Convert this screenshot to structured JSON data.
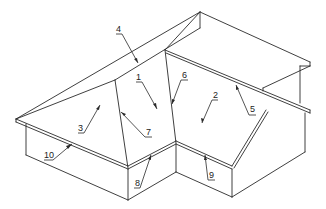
{
  "diagram": {
    "type": "isometric roof line drawing",
    "background": "#ffffff",
    "stroke_color": "#2a2a2a",
    "callouts": [
      {
        "id": "1",
        "label": "1",
        "x": 136,
        "y": 81,
        "arrow_to": [
          157,
          109
        ]
      },
      {
        "id": "2",
        "label": "2",
        "x": 214,
        "y": 99,
        "arrow_to": [
          202,
          123
        ]
      },
      {
        "id": "3",
        "label": "3",
        "x": 78,
        "y": 132,
        "arrow_to": [
          100,
          105
        ]
      },
      {
        "id": "4",
        "label": "4",
        "x": 116,
        "y": 33,
        "arrow_to": [
          138,
          63
        ]
      },
      {
        "id": "5",
        "label": "5",
        "x": 250,
        "y": 113,
        "arrow_to": [
          236,
          85
        ]
      },
      {
        "id": "6",
        "label": "6",
        "x": 183,
        "y": 79,
        "arrow_to": [
          172,
          104
        ]
      },
      {
        "id": "7",
        "label": "7",
        "x": 146,
        "y": 136,
        "arrow_to": [
          121,
          112
        ]
      },
      {
        "id": "8",
        "label": "8",
        "x": 135,
        "y": 186,
        "arrow_to": [
          151,
          155
        ]
      },
      {
        "id": "9",
        "label": "9",
        "x": 210,
        "y": 178,
        "arrow_to": [
          205,
          155
        ]
      },
      {
        "id": "10",
        "label": "10",
        "x": 45,
        "y": 159,
        "arrow_to": [
          72,
          144
        ]
      }
    ]
  }
}
